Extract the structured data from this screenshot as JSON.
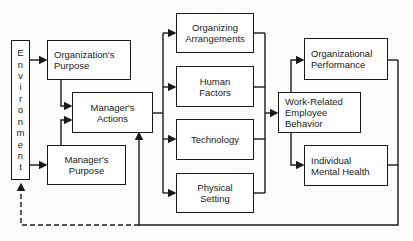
{
  "diagram": {
    "environment": {
      "label": "Environment",
      "letters": [
        "E",
        "n",
        "v",
        "i",
        "r",
        "o",
        "n",
        "m",
        "e",
        "n",
        "t"
      ]
    },
    "boxes": {
      "org_purpose": "Organization's\nPurpose",
      "mgr_purpose": "Manager's\nPurpose",
      "mgr_actions": "Manager's\nActions",
      "organizing": "Organizing\nArrangements",
      "human": "Human\nFactors",
      "technology": "Technology",
      "physical": "Physical\nSetting",
      "behavior": "Work-Related\nEmployee\nBehavior",
      "performance": "Organizational\nPerformance",
      "mental_health": "Individual\nMental Health"
    },
    "feedback": {
      "solid_to": "Manager's Actions",
      "dashed_to": "Environment"
    },
    "colors": {
      "line": "#1a1a1a",
      "background": "#fcfcfb"
    }
  }
}
